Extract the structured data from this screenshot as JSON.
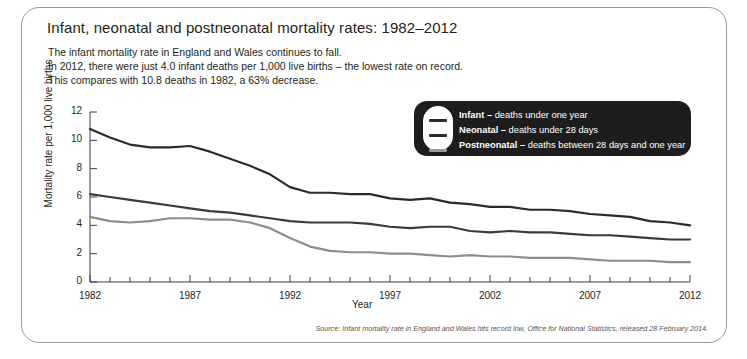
{
  "title": "Infant, neonatal and postneonatal mortality rates: 1982–2012",
  "subtitle": {
    "line1": "The infant mortality rate in England and Wales continues to fall.",
    "line2": "In 2012, there were just 4.0 infant deaths per 1,000 live births – the lowest rate on record.",
    "line3": "This compares with 10.8 deaths in 1982, a 63% decrease."
  },
  "source": "Source: Infant mortality rate in England and Wales hits record low, Office for National Statistics, released 28 February 2014.",
  "legend": {
    "items": [
      {
        "name": "Infant",
        "dash": "–",
        "desc": "deaths under one year",
        "color": "#2b2b2b"
      },
      {
        "name": "Neonatal",
        "dash": "–",
        "desc": " deaths under 28 days",
        "color": "#3a3a3a"
      },
      {
        "name": "Postneonatal",
        "dash": "–",
        "desc": " deaths between 28 days and one year",
        "color": "#8d8d8d"
      }
    ]
  },
  "chart_data": {
    "type": "line",
    "title": "Infant, neonatal and postneonatal mortality rates: 1982–2012",
    "xlabel": "Year",
    "ylabel": "Mortality rate per 1,000 live births",
    "xlim": [
      1982,
      2012
    ],
    "ylim": [
      0,
      12
    ],
    "ytick_labels": [
      "0",
      "2",
      "4",
      "6",
      "8",
      "10",
      "12"
    ],
    "yticks": [
      0,
      2,
      4,
      6,
      8,
      10,
      12
    ],
    "xtick_labels": [
      "1982",
      "1987",
      "1992",
      "1997",
      "2002",
      "2007",
      "2012"
    ],
    "xticks": [
      1982,
      1987,
      1992,
      1997,
      2002,
      2007,
      2012
    ],
    "minor_xticks_every": 1,
    "grid": false,
    "legend_position": "top-right",
    "x": [
      1982,
      1983,
      1984,
      1985,
      1986,
      1987,
      1988,
      1989,
      1990,
      1991,
      1992,
      1993,
      1994,
      1995,
      1996,
      1997,
      1998,
      1999,
      2000,
      2001,
      2002,
      2003,
      2004,
      2005,
      2006,
      2007,
      2008,
      2009,
      2010,
      2011,
      2012
    ],
    "series": [
      {
        "name": "Infant",
        "color": "#2b2b2b",
        "values": [
          10.8,
          10.2,
          9.7,
          9.5,
          9.5,
          9.6,
          9.2,
          8.7,
          8.2,
          7.6,
          6.7,
          6.3,
          6.3,
          6.2,
          6.2,
          5.9,
          5.8,
          5.9,
          5.6,
          5.5,
          5.3,
          5.3,
          5.1,
          5.1,
          5.0,
          4.8,
          4.7,
          4.6,
          4.3,
          4.2,
          4.0
        ]
      },
      {
        "name": "Neonatal",
        "color": "#3a3a3a",
        "values": [
          6.2,
          6.0,
          5.8,
          5.6,
          5.4,
          5.2,
          5.0,
          4.9,
          4.7,
          4.5,
          4.3,
          4.2,
          4.2,
          4.2,
          4.1,
          3.9,
          3.8,
          3.9,
          3.9,
          3.6,
          3.5,
          3.6,
          3.5,
          3.5,
          3.4,
          3.3,
          3.3,
          3.2,
          3.1,
          3.0,
          3.0
        ]
      },
      {
        "name": "Postneonatal",
        "color": "#8d8d8d",
        "values": [
          4.6,
          4.3,
          4.2,
          4.3,
          4.5,
          4.5,
          4.4,
          4.4,
          4.2,
          3.8,
          3.1,
          2.5,
          2.2,
          2.1,
          2.1,
          2.0,
          2.0,
          1.9,
          1.8,
          1.9,
          1.8,
          1.8,
          1.7,
          1.7,
          1.7,
          1.6,
          1.5,
          1.5,
          1.5,
          1.4,
          1.4
        ]
      }
    ]
  }
}
